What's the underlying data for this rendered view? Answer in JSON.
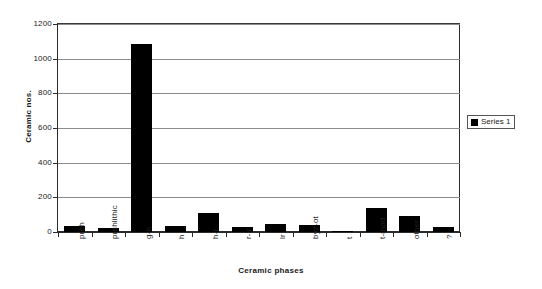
{
  "chart_data": {
    "type": "bar",
    "title": "",
    "subtitle": "",
    "xlabel": "Ceramic phases",
    "ylabel": "Ceramic nos.",
    "categories": [
      "preh",
      "prehlithic",
      "g-h",
      "h",
      "h-r",
      "r-lr",
      "lr",
      "byz-ot",
      "t",
      "t-mod",
      "other",
      "?"
    ],
    "values": [
      35,
      25,
      1085,
      32,
      110,
      28,
      48,
      40,
      3,
      140,
      90,
      28
    ],
    "series": [
      {
        "name": "Series 1",
        "values": [
          35,
          25,
          1085,
          32,
          110,
          28,
          48,
          40,
          3,
          140,
          90,
          28
        ],
        "color": "#000000"
      }
    ],
    "ylim": [
      0,
      1200
    ],
    "ytick_step": 200,
    "ytick_labels": [
      "0",
      "200",
      "400",
      "600",
      "800",
      "1000",
      "1200"
    ],
    "grid": true,
    "grid_axis": "y",
    "legend_position": "right",
    "bar_color": "#000000"
  },
  "legend": {
    "entries": [
      {
        "label": "Series 1",
        "swatch_color": "#000000"
      }
    ]
  },
  "axes": {
    "y_title": "Ceramic nos.",
    "x_title": "Ceramic phases"
  },
  "colors": {
    "bar": "#000000",
    "gridline": "#8b8b8b",
    "axis": "#2b2b2b",
    "background": "#ffffff",
    "text": "#1a1a1a"
  }
}
